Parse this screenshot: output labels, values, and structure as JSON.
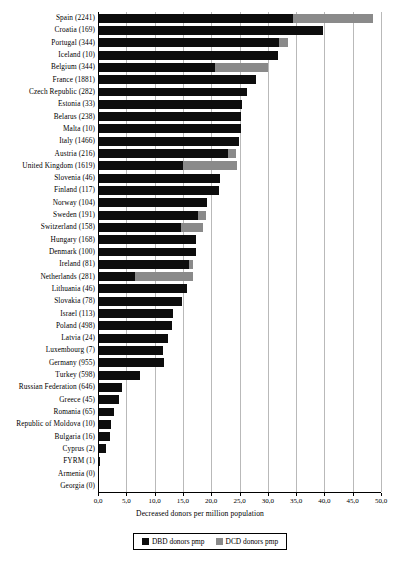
{
  "chart_data": {
    "type": "bar",
    "orientation": "horizontal",
    "title": "",
    "xlabel": "Decreased donors per million population",
    "ylabel": "",
    "xlim": [
      0.0,
      50.0
    ],
    "xticks": [
      "0,0",
      "5,0",
      "10,0",
      "15,0",
      "20,0",
      "25,0",
      "30,0",
      "35,0",
      "40,0",
      "45,0",
      "50,0"
    ],
    "xtick_values": [
      0,
      5,
      10,
      15,
      20,
      25,
      30,
      35,
      40,
      45,
      50
    ],
    "grid": true,
    "stacked": true,
    "legend_position": "bottom",
    "series": [
      {
        "name": "DBD donors pmp",
        "color": "#0d0d0d"
      },
      {
        "name": "DCD donors pmp",
        "color": "#8a8a8a"
      }
    ],
    "categories": [
      "Spain (2241)",
      "Croatia (169)",
      "Portugal (344)",
      "Iceland (10)",
      "Belgium (344)",
      "France (1881)",
      "Czech Republic (282)",
      "Estonia (33)",
      "Belarus (238)",
      "Malta (10)",
      "Italy (1466)",
      "Austria (216)",
      "United Kingdom (1619)",
      "Slovenia (46)",
      "Finland (117)",
      "Norway (104)",
      "Sweden (191)",
      "Switzerland (158)",
      "Hungary (168)",
      "Denmark (100)",
      "Ireland (81)",
      "Netherlands (281)",
      "Lithuania (46)",
      "Slovakia (78)",
      "Israel (113)",
      "Poland (498)",
      "Latvia (24)",
      "Luxembourg (7)",
      "Germany (955)",
      "Turkey (598)",
      "Russian Federation (646)",
      "Greece (45)",
      "Romania (65)",
      "Republic of Moldova (10)",
      "Bulgaria (16)",
      "Cyprus (2)",
      "FYRM (1)",
      "Armenia (0)",
      "Georgia (0)"
    ],
    "dbd_values": [
      34.5,
      39.8,
      32.0,
      31.8,
      20.7,
      28.0,
      26.3,
      25.4,
      25.2,
      25.2,
      24.9,
      22.9,
      15.1,
      21.6,
      21.3,
      19.2,
      17.6,
      14.7,
      17.3,
      17.4,
      16.1,
      6.5,
      15.8,
      14.9,
      13.3,
      13.1,
      12.3,
      11.5,
      11.7,
      7.4,
      4.3,
      3.7,
      2.8,
      2.3,
      2.1,
      1.4,
      0.3,
      0.0,
      0.0
    ],
    "dcd_values": [
      14.0,
      0.0,
      1.5,
      0.0,
      9.3,
      0.0,
      0.0,
      0.0,
      0.0,
      0.0,
      0.0,
      1.4,
      9.4,
      0.0,
      0.0,
      0.0,
      1.4,
      3.9,
      0.0,
      0.0,
      0.7,
      10.2,
      0.0,
      0.0,
      0.0,
      0.0,
      0.0,
      0.0,
      0.0,
      0.0,
      0.0,
      0.0,
      0.0,
      0.0,
      0.0,
      0.0,
      0.0,
      0.0,
      0.0
    ]
  },
  "legend": {
    "dbd_label": "DBD donors pmp",
    "dcd_label": "DCD donors pmp"
  },
  "axis": {
    "x_title": "Decreased donors per million population"
  }
}
